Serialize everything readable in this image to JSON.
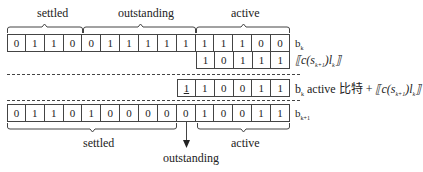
{
  "top": {
    "labels": {
      "settled": "settled",
      "outstanding": "outstanding",
      "active": "active"
    },
    "bk_row": [
      "0",
      "1",
      "1",
      "0",
      "0",
      "1",
      "1",
      "1",
      "1",
      "1",
      "1",
      "1",
      "1",
      "0",
      "0"
    ],
    "bk_label": "b",
    "bk_sub": "k",
    "carry_row": [
      "1",
      "0",
      "1",
      "1",
      "1"
    ],
    "carry_label": "⟦c(s",
    "carry_label_sub": "k+1",
    "carry_label_tail": ")l",
    "carry_label_tail_sub": "k",
    "carry_label_end": "⟧"
  },
  "middle": {
    "sum_row": [
      "1",
      "1",
      "0",
      "0",
      "1",
      "1"
    ],
    "sum_row_underlined_index": 0,
    "sum_label_b": "b",
    "sum_label_b_sub": "k",
    "sum_label_text": " active 比特 + ",
    "sum_label_math": "⟦c(s",
    "sum_label_math_sub": "k+1",
    "sum_label_math_tail": ")l",
    "sum_label_math_tail_sub": "k",
    "sum_label_math_end": "⟧"
  },
  "bottom": {
    "bk1_row": [
      "0",
      "1",
      "1",
      "0",
      "1",
      "0",
      "0",
      "0",
      "0",
      "0",
      "1",
      "0",
      "0",
      "1",
      "1"
    ],
    "bk1_label": "b",
    "bk1_sub": "k+1",
    "labels": {
      "settled": "settled",
      "outstanding": "outstanding",
      "active": "active"
    }
  }
}
